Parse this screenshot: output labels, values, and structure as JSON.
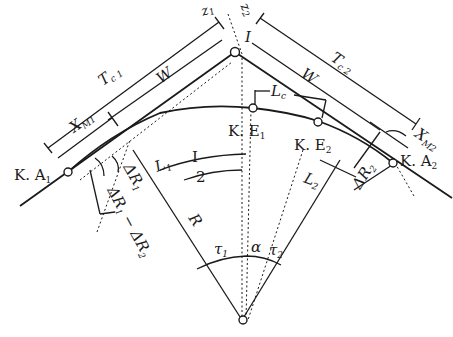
{
  "diagram": {
    "type": "compound curve with clothoid transitions (highway alignment)",
    "points": {
      "ka1": "K. A",
      "ka1_sub": "1",
      "ka2": "K. A",
      "ka2_sub": "2",
      "ke1": "K. E",
      "ke1_sub": "1",
      "ke2": "K. E",
      "ke2_sub": "2"
    },
    "dimensions": {
      "tc1": "T",
      "tc1_sub": "c 1",
      "tc2": "T",
      "tc2_sub": "c 2",
      "w_left": "W",
      "w_right": "W",
      "xm1": "X",
      "xm1_sub": "M1",
      "xm2": "X",
      "xm2_sub": "M2",
      "z1": "z",
      "z1_sub": "1",
      "z2": "z",
      "z2_sub": "2",
      "lc": "L",
      "lc_sub": "c",
      "l1": "L",
      "l1_sub": "1",
      "l2": "L",
      "l2_sub": "2",
      "dr1": "ΔR",
      "dr1_sub": "1",
      "dr2": "ΔR",
      "dr2_sub": "2",
      "dr_diff_a": "ΔR",
      "dr_diff_a_sub": "1",
      "dr_diff_b": "− ΔR",
      "dr_diff_b_sub": "2",
      "r": "R",
      "i_top": "I",
      "i_half_num": "I",
      "i_half_den": "2"
    },
    "angles": {
      "tau1": "τ",
      "tau1_sub": "1",
      "alpha": "α",
      "tau2": "τ",
      "tau2_sub": "2"
    }
  }
}
